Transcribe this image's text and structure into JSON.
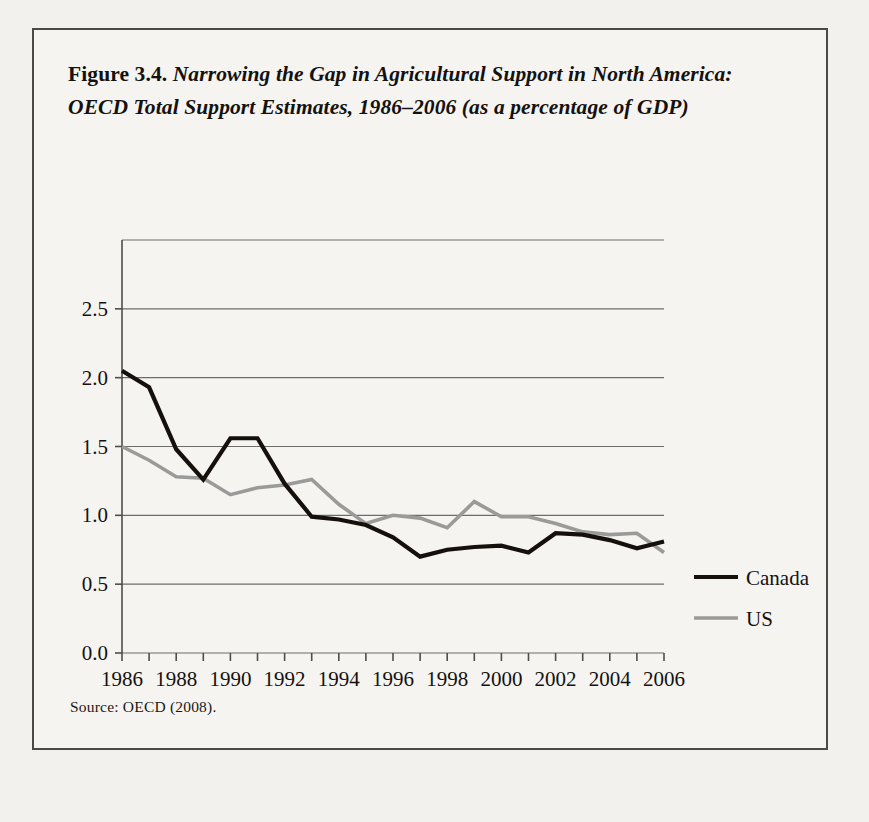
{
  "figure": {
    "label": "Figure 3.4.",
    "title": "Narrowing the Gap in Agricultural Support in North America: OECD Total Support Estimates, 1986–2006 (as a percentage of GDP)",
    "source": "Source: OECD (2008)."
  },
  "colors": {
    "canada": "#16100c",
    "us": "#9a9a98",
    "grid": "#6e6c69",
    "axis": "#4f4d4a",
    "page_background": "#f2f1ed",
    "figure_background": "#f5f4f0",
    "border": "#4b4a48"
  },
  "chart_data": {
    "type": "line",
    "title": "Narrowing the Gap in Agricultural Support in North America: OECD Total Support Estimates, 1986–2006 (as a percentage of GDP)",
    "xlabel": "",
    "ylabel": "",
    "xlim": [
      1986,
      2006
    ],
    "ylim": [
      0.0,
      3.0
    ],
    "grid": true,
    "legend_position": "right",
    "x": [
      1986,
      1987,
      1988,
      1989,
      1990,
      1991,
      1992,
      1993,
      1994,
      1995,
      1996,
      1997,
      1998,
      1999,
      2000,
      2001,
      2002,
      2003,
      2004,
      2005,
      2006
    ],
    "xticks": [
      1986,
      1987,
      1988,
      1989,
      1990,
      1991,
      1992,
      1993,
      1994,
      1995,
      1996,
      1997,
      1998,
      1999,
      2000,
      2001,
      2002,
      2003,
      2004,
      2005,
      2006
    ],
    "xticklabels": [
      "1986",
      "",
      "1988",
      "",
      "1990",
      "",
      "1992",
      "",
      "1994",
      "",
      "1996",
      "",
      "1998",
      "",
      "2000",
      "",
      "2002",
      "",
      "2004",
      "",
      "2006"
    ],
    "yticks": [
      0.0,
      0.5,
      1.0,
      1.5,
      2.0,
      2.5
    ],
    "yticklabels": [
      "0.0",
      "0.5",
      "1.0",
      "1.5",
      "2.0",
      "2.5"
    ],
    "series": [
      {
        "name": "Canada",
        "color": "#16100c",
        "values": [
          2.05,
          1.93,
          1.48,
          1.26,
          1.56,
          1.56,
          1.23,
          0.99,
          0.97,
          0.93,
          0.84,
          0.7,
          0.75,
          0.77,
          0.78,
          0.73,
          0.87,
          0.86,
          0.82,
          0.76,
          0.81
        ]
      },
      {
        "name": "US",
        "color": "#9a9a98",
        "values": [
          1.5,
          1.4,
          1.28,
          1.27,
          1.15,
          1.2,
          1.22,
          1.26,
          1.08,
          0.94,
          1.0,
          0.98,
          0.91,
          1.1,
          0.99,
          0.99,
          0.94,
          0.88,
          0.86,
          0.87,
          0.73
        ]
      }
    ]
  },
  "legend": {
    "items": [
      {
        "label": "Canada",
        "color": "#16100c"
      },
      {
        "label": "US",
        "color": "#9a9a98"
      }
    ]
  }
}
